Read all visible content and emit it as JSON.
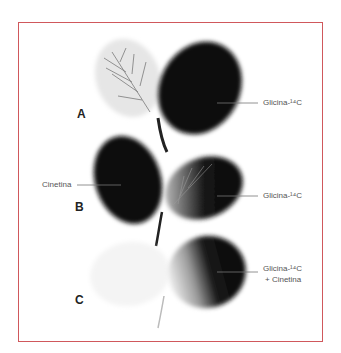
{
  "figure": {
    "frame_color": "#d0585c",
    "panels": [
      {
        "letter": "A",
        "right_label": "Glicina-¹⁴C"
      },
      {
        "letter": "B",
        "left_label": "Cinetina",
        "right_label": "Glicina-¹⁴C"
      },
      {
        "letter": "C",
        "right_label_line1": "Glicina-¹⁴C",
        "right_label_line2": "+ Cinetina"
      }
    ]
  }
}
